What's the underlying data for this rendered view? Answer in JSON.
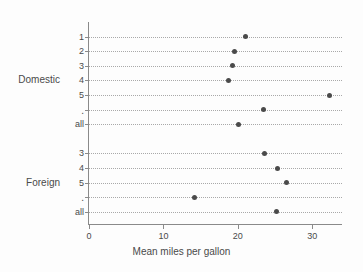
{
  "chart_data": {
    "type": "scatter",
    "title": "",
    "xlabel": "Mean miles per gallon",
    "ylabel": "",
    "xlim": [
      0,
      34
    ],
    "ylim": [
      0,
      13
    ],
    "grid": true,
    "legend": false,
    "orientation": "horizontal",
    "x_ticks": [
      {
        "value": 0,
        "label": "0"
      },
      {
        "value": 10,
        "label": "10"
      },
      {
        "value": 20,
        "label": "20"
      },
      {
        "value": 30,
        "label": "30"
      }
    ],
    "groups": [
      {
        "name": "Domestic",
        "label": "Domestic",
        "label_row": 3,
        "rows": [
          {
            "label": "1",
            "value": 21.0
          },
          {
            "label": "2",
            "value": 19.5
          },
          {
            "label": "3",
            "value": 19.3
          },
          {
            "label": "4",
            "value": 18.8
          },
          {
            "label": "5",
            "value": 32.3
          },
          {
            "label": ".",
            "value": 23.5
          },
          {
            "label": "all",
            "value": 20.1
          }
        ]
      },
      {
        "name": "Foreign",
        "label": "Foreign",
        "label_row": 2,
        "rows": [
          {
            "label": "3",
            "value": 23.6
          },
          {
            "label": "4",
            "value": 25.3
          },
          {
            "label": "5",
            "value": 26.5
          },
          {
            "label": ".",
            "value": 14.2
          },
          {
            "label": "all",
            "value": 25.2
          }
        ]
      }
    ],
    "colors": {
      "dot": "#4a4a4a",
      "axis": "#8a8a8a",
      "grid": "#a9a9a9",
      "text": "#4a4a4a",
      "background": "#fdfdfd"
    }
  }
}
